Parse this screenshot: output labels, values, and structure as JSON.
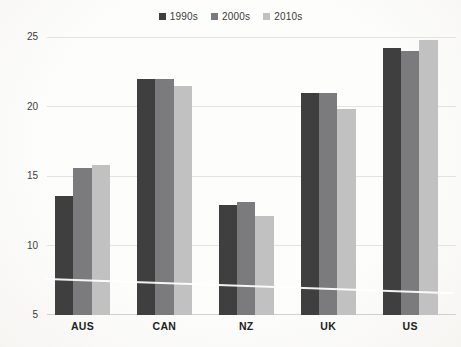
{
  "chart_data": {
    "type": "bar",
    "title": "",
    "xlabel": "",
    "ylabel": "",
    "categories": [
      "AUS",
      "CAN",
      "NZ",
      "UK",
      "US"
    ],
    "series": [
      {
        "name": "1990s",
        "color": "#3f3f3f",
        "values": [
          13.6,
          22.0,
          12.9,
          21.0,
          24.2
        ]
      },
      {
        "name": "2000s",
        "color": "#7b7b7d",
        "values": [
          15.6,
          22.0,
          13.1,
          21.0,
          24.0
        ]
      },
      {
        "name": "2010s",
        "color": "#c1c1c1",
        "values": [
          15.8,
          21.5,
          12.1,
          19.8,
          24.8
        ]
      }
    ],
    "ylim": [
      5,
      25
    ],
    "yticks": [
      5,
      10,
      15,
      20,
      25
    ],
    "grid": true,
    "legend_position": "top"
  },
  "colors": {
    "gridline": "#e5e3e0",
    "baseline": "#d2d0cc",
    "axis_text": "#3c3c3c",
    "category_text": "#222120",
    "background": "#fcfbf9"
  }
}
